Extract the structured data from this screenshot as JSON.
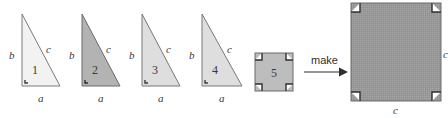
{
  "figure": {
    "background": "#ffffff",
    "stroke_color": "#6e6e6e",
    "text_color": "#3a3a3a"
  },
  "triangles": [
    {
      "number": "1",
      "leg_vertical_label": "b",
      "leg_horizontal_label": "a",
      "hypotenuse_label": "c",
      "fill": "#f2f2f2",
      "x": 12,
      "y": 14,
      "w": 48,
      "h": 72
    },
    {
      "number": "2",
      "leg_vertical_label": "b",
      "leg_horizontal_label": "a",
      "hypotenuse_label": "c",
      "fill": "#b3b3b3",
      "x": 72,
      "y": 14,
      "w": 48,
      "h": 72
    },
    {
      "number": "3",
      "leg_vertical_label": "b",
      "leg_horizontal_label": "a",
      "hypotenuse_label": "c",
      "fill": "#dedede",
      "x": 132,
      "y": 14,
      "w": 48,
      "h": 72
    },
    {
      "number": "4",
      "leg_vertical_label": "b",
      "leg_horizontal_label": "a",
      "hypotenuse_label": "c",
      "fill": "#dedede",
      "x": 192,
      "y": 14,
      "w": 48,
      "h": 72
    }
  ],
  "small_square": {
    "number": "5",
    "fill": "#bdbdbd",
    "x": 255,
    "y": 53,
    "size": 38,
    "corner_marks": 4
  },
  "arrow": {
    "label": "make",
    "x": 305,
    "y": 62,
    "length": 40
  },
  "big_square": {
    "fill": "#999999",
    "side_label_right": "c",
    "side_label_bottom": "c",
    "x": 351,
    "y": 3,
    "size": 90,
    "corner_marks": 4
  }
}
